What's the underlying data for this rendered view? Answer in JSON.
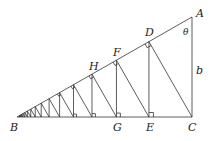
{
  "diagram": {
    "type": "geometry",
    "points": {
      "A": {
        "label": "A",
        "x": 192,
        "y": 17
      },
      "B": {
        "label": "B",
        "x": 17,
        "y": 117
      },
      "C": {
        "label": "C",
        "x": 192,
        "y": 117
      }
    },
    "labels": {
      "A": "A",
      "B": "B",
      "C": "C",
      "D": "D",
      "E": "E",
      "F": "F",
      "G": "G",
      "H": "H",
      "theta": "θ",
      "b": "b"
    },
    "iterations": 16,
    "colors": {
      "line": "#333333",
      "text": "#222222",
      "background": "#ffffff"
    }
  }
}
